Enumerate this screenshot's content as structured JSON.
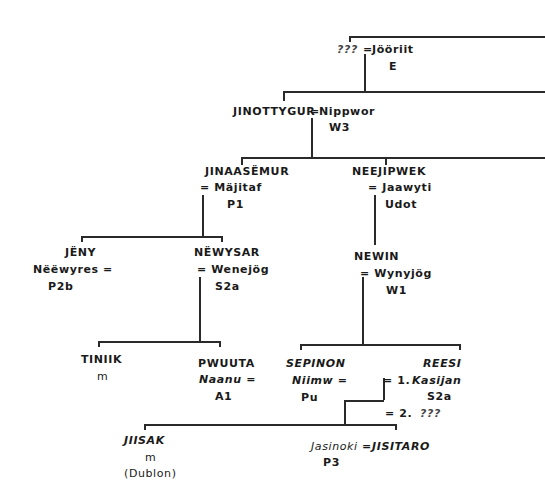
{
  "diagram": {
    "type": "genealogy",
    "gen1": {
      "left": "???",
      "eq": "=",
      "spouse": "Jööriit",
      "code": "E"
    },
    "gen2": {
      "name": "JINOTTYGUR",
      "eq": "=",
      "spouse": "Nippwor",
      "code": "W3"
    },
    "gen3": [
      {
        "name": "JINAASËMUR",
        "spouse": "= Mäjitaf",
        "code": "P1"
      },
      {
        "name": "NEEJIPWEK",
        "spouse": "= Jaawyti",
        "code": "Udot"
      }
    ],
    "gen4": [
      {
        "name": "JËNY",
        "spouse": "Nëëwyres =",
        "code": "P2b"
      },
      {
        "name": "NËWYSAR",
        "spouse": "= Wenejög",
        "code": "S2a"
      },
      {
        "name": "NEWIN",
        "spouse": "= Wynyjög",
        "code": "W1"
      }
    ],
    "gen5": [
      {
        "name": "TINIIK",
        "sub": "m"
      },
      {
        "name": "PWUUTA",
        "spouse": "Naanu =",
        "code": "A1"
      },
      {
        "name": "SEPINON",
        "spouse": "Niimw =",
        "code": "Pu"
      },
      {
        "name": "REESI",
        "m1": "= 1.",
        "spouse1": "Kasijan",
        "code1": "S2a",
        "m2": "= 2.",
        "spouse2": "???"
      }
    ],
    "gen6": [
      {
        "name": "JIISAK",
        "sub": "m",
        "place": "(Dublon)"
      },
      {
        "spouse": "Jasinoki",
        "eq": "=",
        "name": "JISITARO",
        "code": "P3"
      }
    ]
  }
}
